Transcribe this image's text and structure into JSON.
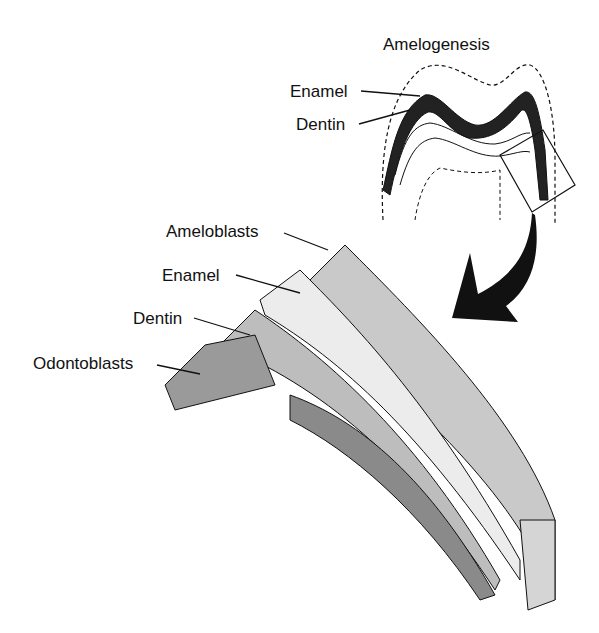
{
  "title": "Amelogenesis",
  "inset_labels": {
    "enamel": "Enamel",
    "dentin": "Dentin"
  },
  "detail_labels": {
    "ameloblasts": "Ameloblasts",
    "enamel": "Enamel",
    "dentin": "Dentin",
    "odontoblasts": "Odontoblasts"
  },
  "colors": {
    "ink": "#111111",
    "cell_gray": "#c9c9c9",
    "dark_gray": "#8a8a8a",
    "enamel_light": "#ececec",
    "background": "#ffffff"
  },
  "icons": {
    "arrow": "curved-arrow-down-left"
  }
}
